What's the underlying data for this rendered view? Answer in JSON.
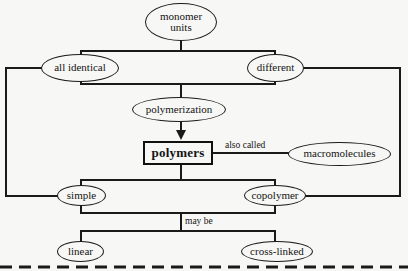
{
  "diagram": {
    "background_color": "#f7f7f5",
    "line_color": "#1a1a1a",
    "nodes": {
      "monomer_units": "monomer\nunits",
      "monomer_units_line1": "monomer",
      "monomer_units_line2": "units",
      "all_identical": "all  identical",
      "different": "different",
      "polymerization": "polymerization",
      "polymers": "polymers",
      "macromolecules": "macromolecules",
      "simple": "simple",
      "copolymer": "copolymer",
      "linear": "linear",
      "cross_linked": "cross-linked"
    },
    "edge_labels": {
      "also_called": "also called",
      "may_be": "may be"
    },
    "relations": [
      "monomer units -> all identical",
      "monomer units -> different",
      "all identical -> polymerization",
      "different -> polymerization",
      "polymerization -> polymers",
      "polymers -> also called -> macromolecules",
      "polymers -> simple",
      "polymers -> copolymer",
      "all identical -> simple",
      "different -> copolymer",
      "simple -> may be -> linear",
      "copolymer -> may be -> cross-linked"
    ]
  }
}
